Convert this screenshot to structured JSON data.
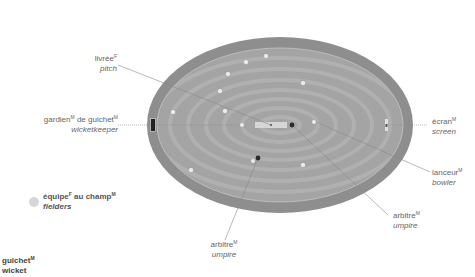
{
  "diagram": {
    "colors": {
      "outer_ring": "#8e8e8e",
      "inner_field": "#a8a8a8",
      "stripe_light": "#b2b2b2",
      "boundary_line": "#c8c8c8",
      "pitch": "#d4d4d4",
      "fielder": "#e8e8e8",
      "umpire": "#3a3a3a",
      "leader_line": "#888888"
    }
  },
  "labels": {
    "pitch": {
      "fr": "livrée",
      "fr_gender": "F",
      "en": "pitch"
    },
    "wicketkeeper": {
      "fr_1": "gardien",
      "fr_1_gender": "M",
      "fr_2": " de guichet",
      "fr_2_gender": "M",
      "en": "wicketkeeper"
    },
    "screen": {
      "fr": "écran",
      "fr_gender": "M",
      "en": "screen"
    },
    "bowler": {
      "fr": "lanceur",
      "fr_gender": "M",
      "en": "bowler"
    },
    "umpire_right": {
      "fr": "arbitre",
      "fr_gender": "M",
      "en": "umpire"
    },
    "umpire_bottom": {
      "fr": "arbitre",
      "fr_gender": "M",
      "en": "umpire"
    },
    "fielders": {
      "fr_1": "équipe",
      "fr_1_gender": "F",
      "fr_2": " au champ",
      "fr_2_gender": "M",
      "en": "fielders"
    },
    "wicket": {
      "fr": "guichet",
      "fr_gender": "M",
      "en": "wicket"
    }
  }
}
